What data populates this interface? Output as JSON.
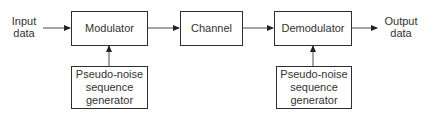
{
  "diagram": {
    "input_label": [
      "Input",
      "data"
    ],
    "output_label": [
      "Output",
      "data"
    ],
    "blocks": {
      "modulator": "Modulator",
      "channel": "Channel",
      "demodulator": "Demodulator",
      "pn_generator_tx": [
        "Pseudo-noise",
        "sequence",
        "generator"
      ],
      "pn_generator_rx": [
        "Pseudo-noise",
        "sequence",
        "generator"
      ]
    },
    "connections": [
      {
        "from": "input",
        "to": "modulator"
      },
      {
        "from": "modulator",
        "to": "channel"
      },
      {
        "from": "channel",
        "to": "demodulator"
      },
      {
        "from": "demodulator",
        "to": "output"
      },
      {
        "from": "pn_generator_tx",
        "to": "modulator"
      },
      {
        "from": "pn_generator_rx",
        "to": "demodulator"
      }
    ],
    "colors": {
      "line": "#5a5a5a",
      "border": "#2e2e2e",
      "text": "#333333"
    }
  }
}
